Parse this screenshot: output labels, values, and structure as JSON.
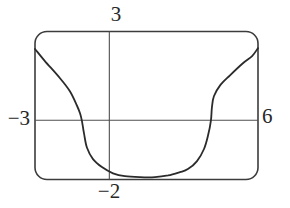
{
  "figure": {
    "labels": {
      "top": "3",
      "left": "−3",
      "right": "6",
      "bottom": "−2"
    },
    "colors": {
      "background": "#ffffff",
      "curve": "#2b2b2b",
      "axis": "#4f4f4f",
      "border": "#3c3c3c"
    }
  },
  "chart_data": {
    "type": "line",
    "title": "",
    "xlabel": "",
    "ylabel": "",
    "xlim": [
      -3,
      6
    ],
    "ylim": [
      -2,
      3
    ],
    "x_tick_labels": [
      "−3",
      "6"
    ],
    "y_tick_labels": [
      "−2",
      "3"
    ],
    "grid": false,
    "legend": false,
    "viewing_rectangle": "[−3, 6] by [−2, 3]",
    "series": [
      {
        "name": "curve",
        "points": [
          [
            -3.0,
            2.41
          ],
          [
            -2.6,
            2.0
          ],
          [
            -1.99,
            1.42
          ],
          [
            -1.59,
            0.98
          ],
          [
            -1.31,
            0.5
          ],
          [
            -1.18,
            0.23
          ],
          [
            -1.1,
            -0.05
          ],
          [
            -1.02,
            -0.46
          ],
          [
            -0.9,
            -0.93
          ],
          [
            -0.66,
            -1.31
          ],
          [
            -0.3,
            -1.58
          ],
          [
            0.15,
            -1.79
          ],
          [
            0.63,
            -1.89
          ],
          [
            1.24,
            -1.92
          ],
          [
            1.84,
            -1.92
          ],
          [
            2.37,
            -1.86
          ],
          [
            2.85,
            -1.75
          ],
          [
            3.17,
            -1.65
          ],
          [
            3.54,
            -1.38
          ],
          [
            3.82,
            -0.97
          ],
          [
            3.98,
            -0.53
          ],
          [
            4.1,
            -0.01
          ],
          [
            4.14,
            0.43
          ],
          [
            4.22,
            0.81
          ],
          [
            4.47,
            1.18
          ],
          [
            4.87,
            1.52
          ],
          [
            5.39,
            1.93
          ],
          [
            5.76,
            2.17
          ],
          [
            6.0,
            2.44
          ]
        ]
      }
    ]
  }
}
